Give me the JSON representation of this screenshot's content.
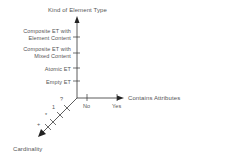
{
  "diagram": {
    "y_axis": {
      "title": "Kind of Element Type",
      "ticks": [
        {
          "line1": "Composite ET with",
          "line2": "Element Content"
        },
        {
          "line1": "Composite ET with",
          "line2": "Mixed Content"
        },
        {
          "line1": "Atomic ET",
          "line2": ""
        },
        {
          "line1": "Empty ET",
          "line2": ""
        }
      ]
    },
    "x_axis": {
      "title": "Contains Attributes",
      "ticks": [
        "No",
        "Yes"
      ]
    },
    "z_axis": {
      "title": "Cardinality",
      "ticks": [
        "?",
        "1",
        "*",
        "+"
      ]
    },
    "colors": {
      "axis": "#333333",
      "text": "#555555"
    }
  }
}
